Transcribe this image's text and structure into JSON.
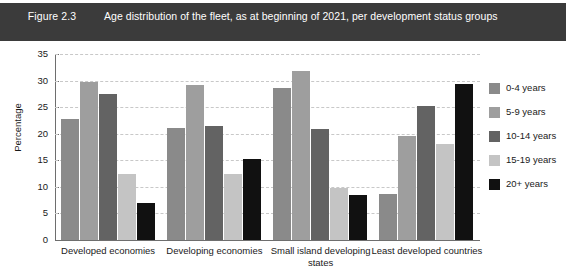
{
  "header": {
    "figure_number": "Figure 2.3",
    "title": "Age distribution of the fleet, as at beginning of 2021, per development status groups",
    "background_color": "#3b3b3b",
    "text_color": "#ffffff"
  },
  "chart_data": {
    "type": "bar",
    "title": "Age distribution of the fleet, as at beginning of 2021, per development status groups",
    "xlabel": "",
    "ylabel": "Percentage",
    "ylim": [
      0,
      35
    ],
    "yticks": [
      0,
      5,
      10,
      15,
      20,
      25,
      30,
      35
    ],
    "ytick_labels": [
      "0",
      "5",
      "10",
      "15",
      "20",
      "25",
      "30",
      "35"
    ],
    "grid": true,
    "grid_style": "dashed",
    "legend_position": "right",
    "categories": [
      "Developed economies",
      "Developing economies",
      "Small island developing states",
      "Least developed countries"
    ],
    "series": [
      {
        "name": "0-4 years",
        "color": "#8a8a8a",
        "values": [
          22.7,
          21.0,
          28.6,
          8.7
        ]
      },
      {
        "name": "5-9 years",
        "color": "#9e9e9e",
        "values": [
          29.7,
          29.1,
          31.8,
          19.5
        ]
      },
      {
        "name": "10-14 years",
        "color": "#636363",
        "values": [
          27.5,
          21.4,
          20.8,
          25.2
        ]
      },
      {
        "name": "15-19 years",
        "color": "#c4c4c4",
        "values": [
          12.5,
          12.5,
          9.7,
          18.1
        ]
      },
      {
        "name": "20+ years",
        "color": "#111111",
        "values": [
          6.9,
          15.3,
          8.4,
          29.4
        ]
      }
    ]
  },
  "legend": {
    "items": [
      {
        "label": "0-4 years",
        "color": "#8a8a8a"
      },
      {
        "label": "5-9 years",
        "color": "#9e9e9e"
      },
      {
        "label": "10-14 years",
        "color": "#636363"
      },
      {
        "label": "15-19 years",
        "color": "#c4c4c4"
      },
      {
        "label": "20+ years",
        "color": "#111111"
      }
    ]
  }
}
